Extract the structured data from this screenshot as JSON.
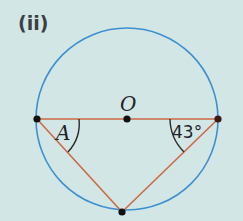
{
  "figure": {
    "part_label": "(ii)",
    "center_label": "O",
    "angle_unknown_label": "A",
    "angle_known_label": "43°",
    "colors": {
      "background": "#d3e6e6",
      "circle": "#3d8fd0",
      "triangle": "#cc6a45",
      "points": "#111111",
      "arcs": "#2b2b2b"
    },
    "geometry": {
      "circle_center": [
        127,
        119
      ],
      "circle_radius": 91,
      "points": {
        "left": [
          37,
          119
        ],
        "right": [
          218,
          119
        ],
        "bottom": [
          122,
          212
        ],
        "center": [
          127,
          119
        ]
      }
    }
  }
}
